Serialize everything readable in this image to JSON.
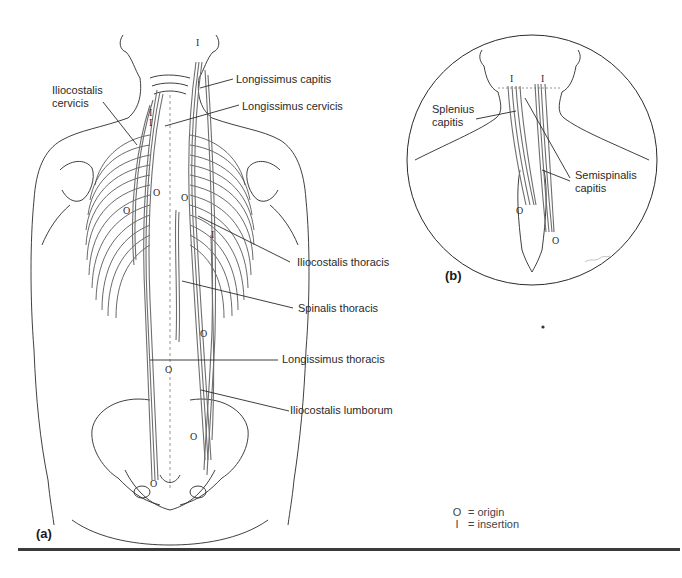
{
  "figure": {
    "panel_a": {
      "tag": "(a)",
      "labels": {
        "iliocostalis_cervicis": "Iliocostalis\ncervicis",
        "longissimus_capitis": "Longissimus capitis",
        "longissimus_cervicis": "Longissimus cervicis",
        "iliocostalis_thoracis": "Iliocostalis thoracis",
        "spinalis_thoracis": "Spinalis thoracis",
        "longissimus_thoracis": "Longissimus thoracis",
        "iliocostalis_lumborum": "Iliocostalis lumborum"
      },
      "markers": {
        "origin": "O",
        "insertion": "I"
      }
    },
    "panel_b": {
      "tag": "(b)",
      "labels": {
        "splenius_capitis": "Splenius\ncapitis",
        "semispinalis_capitis": "Semispinalis\ncapitis"
      },
      "signature": "Milne"
    },
    "legend": {
      "items": [
        {
          "symbol": "O",
          "text": "= origin"
        },
        {
          "symbol": "I",
          "text": "= insertion"
        }
      ]
    },
    "colors": {
      "line": "#2a2a2a",
      "muscle": "#6e6e6e",
      "background": "#ffffff"
    }
  }
}
